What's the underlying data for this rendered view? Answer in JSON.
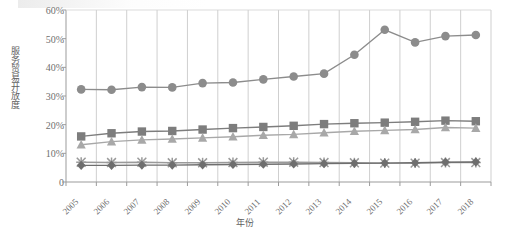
{
  "chart_data": {
    "type": "line",
    "title": "",
    "xlabel": "年份",
    "ylabel": "服务贸易开放度",
    "grid": "vertical",
    "legend_position": "none",
    "ylim": [
      0,
      0.6
    ],
    "ytick_labels": [
      "60%",
      "50%",
      "40%",
      "30%",
      "20%",
      "10%",
      "0"
    ],
    "ytick_values": [
      0.6,
      0.5,
      0.4,
      0.3,
      0.2,
      0.1,
      0.0
    ],
    "categories": [
      "2005",
      "2006",
      "2007",
      "2008",
      "2009",
      "2010",
      "2011",
      "2012",
      "2013",
      "2014",
      "2015",
      "2016",
      "2017",
      "2018"
    ],
    "series": [
      {
        "name": "series-circle",
        "marker": "circle",
        "color": "#8c8c8c",
        "values": [
          0.323,
          0.322,
          0.331,
          0.33,
          0.345,
          0.347,
          0.358,
          0.368,
          0.378,
          0.444,
          0.531,
          0.487,
          0.509,
          0.513
        ]
      },
      {
        "name": "series-square",
        "marker": "square",
        "color": "#7d7d7d",
        "values": [
          0.159,
          0.17,
          0.176,
          0.178,
          0.183,
          0.188,
          0.192,
          0.196,
          0.202,
          0.205,
          0.207,
          0.21,
          0.214,
          0.212
        ]
      },
      {
        "name": "series-triangle",
        "marker": "triangle",
        "color": "#a8a8a8",
        "values": [
          0.13,
          0.141,
          0.147,
          0.15,
          0.154,
          0.158,
          0.163,
          0.166,
          0.172,
          0.177,
          0.18,
          0.183,
          0.19,
          0.188
        ]
      },
      {
        "name": "series-cross",
        "marker": "cross",
        "color": "#9a9a9a",
        "values": [
          0.069,
          0.068,
          0.069,
          0.067,
          0.067,
          0.068,
          0.069,
          0.069,
          0.068,
          0.067,
          0.066,
          0.066,
          0.068,
          0.068
        ]
      },
      {
        "name": "series-diamond",
        "marker": "diamond",
        "color": "#6e6e6e",
        "values": [
          0.058,
          0.058,
          0.059,
          0.059,
          0.06,
          0.061,
          0.062,
          0.063,
          0.064,
          0.065,
          0.066,
          0.067,
          0.069,
          0.07
        ]
      }
    ]
  },
  "axis": {
    "y_title": "服务贸易开放度",
    "x_title": "年份"
  }
}
